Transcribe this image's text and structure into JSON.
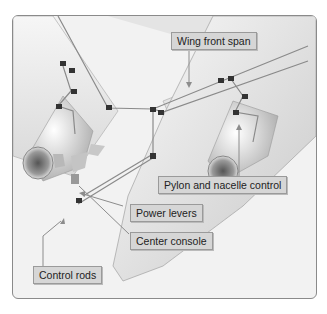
{
  "figure": {
    "labels": {
      "wing_front_span": "Wing front span",
      "pylon_nacelle_control": "Pylon and nacelle control",
      "power_levers": "Power levers",
      "center_console": "Center console",
      "control_rods": "Control rods"
    }
  },
  "colors": {
    "background": "#ffffff",
    "frame_fill": "#f2f2f2",
    "label_fill": "#d6d6d6",
    "label_border": "#9a9a9a",
    "leader_line": "#8c8c8c"
  }
}
